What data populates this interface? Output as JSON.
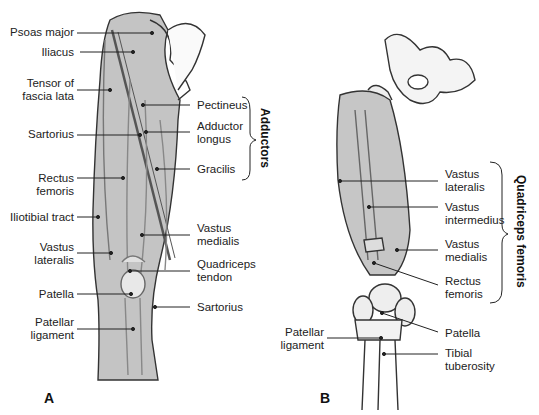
{
  "figure": {
    "panel_a": {
      "letter": "A",
      "labels_left": [
        {
          "text": "Psoas major"
        },
        {
          "text": "Iliacus"
        },
        {
          "text": "Tensor of\nfascia lata"
        },
        {
          "text": "Sartorius"
        },
        {
          "text": "Rectus\nfemoris"
        },
        {
          "text": "Iliotibial tract"
        },
        {
          "text": "Vastus\nlateralis"
        },
        {
          "text": "Patella"
        },
        {
          "text": "Patellar\nligament"
        }
      ],
      "labels_right": [
        {
          "text": "Pectineus"
        },
        {
          "text": "Adductor\nlongus"
        },
        {
          "text": "Gracilis"
        },
        {
          "text": "Vastus\nmedialis"
        },
        {
          "text": "Quadriceps\ntendon"
        },
        {
          "text": "Sartorius"
        }
      ],
      "group_label": "Adductors"
    },
    "panel_b": {
      "letter": "B",
      "labels_left": [
        {
          "text": "Patellar\nligament"
        }
      ],
      "labels_right": [
        {
          "text": "Vastus\nlateralis"
        },
        {
          "text": "Vastus\nintermedius"
        },
        {
          "text": "Vastus\nmedialis"
        },
        {
          "text": "Rectus\nfemoris"
        },
        {
          "text": "Patella"
        },
        {
          "text": "Tibial\ntuberosity"
        }
      ],
      "group_label": "Quadriceps femoris"
    }
  }
}
